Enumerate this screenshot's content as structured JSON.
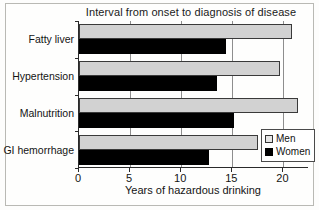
{
  "chart_data": {
    "type": "bar",
    "orientation": "horizontal",
    "title": "Interval from onset to diagnosis of disease",
    "xlabel": "Years of hazardous drinking",
    "ylabel": "",
    "categories": [
      "Fatty liver",
      "Hypertension",
      "Malnutrition",
      "GI hemorrhage"
    ],
    "series": [
      {
        "name": "Men",
        "color": "#d2d2d2",
        "values": [
          20.8,
          19.7,
          21.4,
          17.5
        ]
      },
      {
        "name": "Women",
        "color": "#000000",
        "values": [
          14.4,
          13.5,
          15.2,
          12.7
        ]
      }
    ],
    "xlim": [
      0,
      22.5
    ],
    "xticks": [
      0,
      5,
      10,
      15,
      20
    ],
    "xtick_labels": [
      "0",
      "5",
      "10",
      "15",
      "20"
    ],
    "grid": true,
    "grid_axis": "x",
    "legend_position": "bottom-right"
  },
  "legend": {
    "entries": [
      {
        "label": "Men",
        "swatch": "men"
      },
      {
        "label": "Women",
        "swatch": "women"
      }
    ]
  }
}
